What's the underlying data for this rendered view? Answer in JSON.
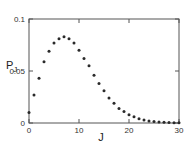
{
  "chart_data": {
    "type": "scatter",
    "title": "",
    "xlabel": "J",
    "ylabel": "P_J",
    "ylabel_main": "P",
    "ylabel_sub": "J",
    "xlim": [
      0,
      30
    ],
    "ylim": [
      0,
      0.1
    ],
    "grid": false,
    "legend": null,
    "x_ticks": [
      0,
      10,
      20,
      30
    ],
    "x_tick_labels": [
      "0",
      "10",
      "20",
      "30"
    ],
    "y_ticks": [
      0,
      0.05,
      0.1
    ],
    "y_tick_labels": [
      "0",
      "0.05",
      "0.1"
    ],
    "series": [
      {
        "name": "P_J",
        "x": [
          0,
          1,
          2,
          3,
          4,
          5,
          6,
          7,
          8,
          9,
          10,
          11,
          12,
          13,
          14,
          15,
          16,
          17,
          18,
          19,
          20,
          21,
          22,
          23,
          24,
          25,
          26,
          27,
          28,
          29,
          30
        ],
        "y": [
          0.01,
          0.027,
          0.043,
          0.059,
          0.069,
          0.077,
          0.081,
          0.083,
          0.081,
          0.077,
          0.07,
          0.062,
          0.055,
          0.046,
          0.038,
          0.031,
          0.024,
          0.019,
          0.014,
          0.011,
          0.008,
          0.006,
          0.004,
          0.003,
          0.002,
          0.0015,
          0.001,
          0.0007,
          0.0005,
          0.0003,
          0.0002
        ]
      }
    ]
  },
  "colors": {
    "axis": "#555555",
    "marker": "#2a2a2a"
  }
}
